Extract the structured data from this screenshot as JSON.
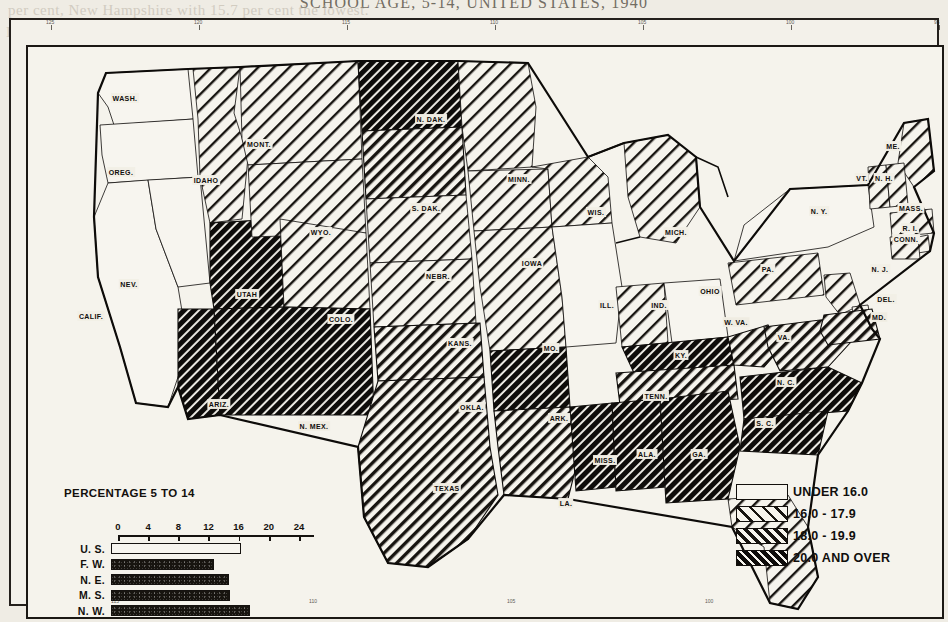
{
  "page": {
    "title": "SCHOOL AGE, 5-14, UNITED STATES, 1940",
    "bleed_lines": [
      {
        "text": "per cent, New Hampshire with 15.7 per cent the lowest.",
        "x": 8,
        "y": 2,
        "size": 15
      },
      {
        "text": "In a general way, it will be seen, the percentages",
        "x": 6,
        "y": 24,
        "size": 15
      },
      {
        "text": "and the proportion of the population",
        "x": 250,
        "y": 46,
        "size": 15
      },
      {
        "text": "to the determination",
        "x": 430,
        "y": 70,
        "size": 15
      },
      {
        "text": "of the population",
        "x": 520,
        "y": 92,
        "size": 15
      },
      {
        "text": "is sufficiently",
        "x": 40,
        "y": 120,
        "size": 15
      },
      {
        "text": "a large share",
        "x": 120,
        "y": 210,
        "size": 15
      },
      {
        "text": "in the burden",
        "x": 560,
        "y": 250,
        "size": 15
      },
      {
        "text": "and school",
        "x": 700,
        "y": 300,
        "size": 15
      },
      {
        "text": "the situation",
        "x": 200,
        "y": 470,
        "size": 15
      },
      {
        "text": "on in the Atlantic States of the",
        "x": 360,
        "y": 516,
        "size": 15
      },
      {
        "text": "percentages of the lowest figures",
        "x": 390,
        "y": 540,
        "size": 15
      },
      {
        "text": "and in part",
        "x": 600,
        "y": 566,
        "size": 15
      }
    ]
  },
  "legend": {
    "items": [
      {
        "label": "UNDER 16.0",
        "pattern": "none"
      },
      {
        "label": "16.0 - 17.9",
        "pattern": "light"
      },
      {
        "label": "18.0 - 19.9",
        "pattern": "medium"
      },
      {
        "label": "20.0 AND OVER",
        "pattern": "dark"
      }
    ]
  },
  "chart_data": {
    "type": "bar",
    "title": "PERCENTAGE 5 TO 14",
    "orientation": "horizontal",
    "categories": [
      "U. S.",
      "F. W.",
      "N. E.",
      "M. S.",
      "N. W.",
      "S. W.",
      "S. E."
    ],
    "values": [
      17.3,
      13.7,
      15.6,
      15.8,
      18.4,
      20.6,
      21.6
    ],
    "fills": [
      "hollow",
      "filled",
      "filled",
      "filled",
      "filled",
      "filled",
      "filled"
    ],
    "xlabel": "",
    "ylabel": "",
    "xlim": [
      0,
      26
    ],
    "xticks": [
      0,
      4,
      8,
      12,
      16,
      20,
      24
    ],
    "xtick_labels": [
      "0",
      "4",
      "8",
      "12",
      "16",
      "20",
      "24"
    ],
    "grid": false,
    "legend": "none"
  },
  "map": {
    "frame_ticks_top": [
      "125",
      "120",
      "115",
      "110",
      "105",
      "100",
      "95"
    ],
    "frame_ticks_bottom": [
      "115",
      "110",
      "105",
      "100"
    ],
    "states": [
      {
        "name": "WASH.",
        "x": 112,
        "y": 76,
        "class": "none"
      },
      {
        "name": "OREG.",
        "x": 108,
        "y": 150,
        "class": "none"
      },
      {
        "name": "IDAHO",
        "x": 193,
        "y": 158,
        "class": "light"
      },
      {
        "name": "NEV.",
        "x": 116,
        "y": 262,
        "class": "none"
      },
      {
        "name": "CALIF.",
        "x": 78,
        "y": 294,
        "class": "none"
      },
      {
        "name": "MONT.",
        "x": 246,
        "y": 122,
        "class": "light"
      },
      {
        "name": "WYO.",
        "x": 308,
        "y": 210,
        "class": "light"
      },
      {
        "name": "UTAH",
        "x": 234,
        "y": 272,
        "class": "dark"
      },
      {
        "name": "COLO.",
        "x": 328,
        "y": 297,
        "class": "light"
      },
      {
        "name": "ARIZ.",
        "x": 206,
        "y": 382,
        "class": "dark"
      },
      {
        "name": "N. MEX.",
        "x": 301,
        "y": 404,
        "class": "dark"
      },
      {
        "name": "N. DAK.",
        "x": 418,
        "y": 97,
        "class": "dark"
      },
      {
        "name": "S. DAK.",
        "x": 413,
        "y": 186,
        "class": "medium"
      },
      {
        "name": "NEBR.",
        "x": 425,
        "y": 254,
        "class": "light"
      },
      {
        "name": "KANS.",
        "x": 447,
        "y": 321,
        "class": "light"
      },
      {
        "name": "OKLA.",
        "x": 459,
        "y": 385,
        "class": "medium"
      },
      {
        "name": "TEXAS",
        "x": 434,
        "y": 466,
        "class": "medium"
      },
      {
        "name": "MINN.",
        "x": 506,
        "y": 157,
        "class": "light"
      },
      {
        "name": "IOWA",
        "x": 519,
        "y": 241,
        "class": "light"
      },
      {
        "name": "MO.",
        "x": 538,
        "y": 326,
        "class": "light"
      },
      {
        "name": "ARK.",
        "x": 546,
        "y": 396,
        "class": "dark"
      },
      {
        "name": "LA.",
        "x": 553,
        "y": 481,
        "class": "medium"
      },
      {
        "name": "WIS.",
        "x": 583,
        "y": 190,
        "class": "light"
      },
      {
        "name": "ILL.",
        "x": 594,
        "y": 283,
        "class": "none"
      },
      {
        "name": "MISS.",
        "x": 592,
        "y": 438,
        "class": "dark"
      },
      {
        "name": "MICH.",
        "x": 663,
        "y": 210,
        "class": "light"
      },
      {
        "name": "IND.",
        "x": 646,
        "y": 283,
        "class": "light"
      },
      {
        "name": "OHIO",
        "x": 697,
        "y": 269,
        "class": "none"
      },
      {
        "name": "KY.",
        "x": 668,
        "y": 333,
        "class": "dark"
      },
      {
        "name": "TENN.",
        "x": 643,
        "y": 374,
        "class": "medium"
      },
      {
        "name": "ALA.",
        "x": 634,
        "y": 432,
        "class": "dark"
      },
      {
        "name": "GA.",
        "x": 686,
        "y": 432,
        "class": "dark"
      },
      {
        "name": "FLA.",
        "x": 752,
        "y": 538,
        "class": "light"
      },
      {
        "name": "W. VA.",
        "x": 723,
        "y": 300,
        "class": "medium"
      },
      {
        "name": "VA.",
        "x": 771,
        "y": 315,
        "class": "medium"
      },
      {
        "name": "N. C.",
        "x": 773,
        "y": 360,
        "class": "dark"
      },
      {
        "name": "S. C.",
        "x": 752,
        "y": 401,
        "class": "dark"
      },
      {
        "name": "PA.",
        "x": 755,
        "y": 247,
        "class": "light"
      },
      {
        "name": "N. Y.",
        "x": 806,
        "y": 189,
        "class": "none"
      },
      {
        "name": "ME.",
        "x": 880,
        "y": 124,
        "class": "light"
      },
      {
        "name": "VT.",
        "x": 849,
        "y": 156,
        "class": "light"
      },
      {
        "name": "N. H.",
        "x": 871,
        "y": 156,
        "class": "light"
      },
      {
        "name": "MASS.",
        "x": 898,
        "y": 186,
        "class": "light"
      },
      {
        "name": "R. I.",
        "x": 897,
        "y": 206,
        "class": "light"
      },
      {
        "name": "CONN.",
        "x": 893,
        "y": 217,
        "class": "light"
      },
      {
        "name": "N. J.",
        "x": 867,
        "y": 247,
        "class": "light"
      },
      {
        "name": "DEL.",
        "x": 873,
        "y": 277,
        "class": "light"
      },
      {
        "name": "MD.",
        "x": 866,
        "y": 295,
        "class": "medium"
      }
    ]
  }
}
